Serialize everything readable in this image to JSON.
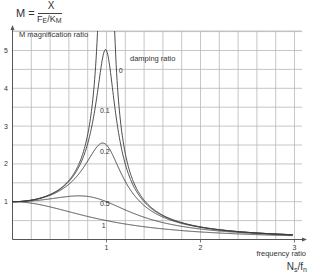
{
  "formula": {
    "lhs": "M =",
    "numerator": "X",
    "denominator_f": "F",
    "denominator_f_sub": "E",
    "denominator_slash": "/",
    "denominator_k": "K",
    "denominator_k_sub": "M"
  },
  "colors": {
    "grid": "#b8b8b8",
    "axis": "#555555",
    "curve": "#3a3a3a",
    "text": "#333333",
    "background": "#ffffff"
  },
  "chart_data": {
    "type": "line",
    "ylabel": "M magnification ratio",
    "xlabel": "frequency ratio",
    "xlabel_symbol": "Ns/fn",
    "legend_title": "damping ratio",
    "xlim": [
      0,
      3.05
    ],
    "ylim": [
      0,
      5.5
    ],
    "x_ticks": [
      1,
      2,
      3
    ],
    "y_ticks": [
      1,
      2,
      3,
      4,
      5
    ],
    "x_grid_step": 0.2,
    "y_grid_step": 0.5,
    "grid": true,
    "formula": "M = 1 / sqrt((1 - r^2)^2 + (2*zeta*r)^2)",
    "series": [
      {
        "name": "0",
        "damping": 0.0,
        "label": "0",
        "label_pos": [
          1.13,
          4.4
        ],
        "x": [
          0,
          0.2,
          0.4,
          0.6,
          0.8,
          0.9,
          1.2,
          1.5,
          2.0,
          2.5,
          3.0
        ],
        "values": [
          1.0,
          1.04,
          1.19,
          1.56,
          2.78,
          5.26,
          2.27,
          0.8,
          0.33,
          0.19,
          0.13
        ]
      },
      {
        "name": "0.1",
        "damping": 0.1,
        "label": "0.1",
        "label_pos": [
          0.93,
          3.35
        ],
        "x": [
          0,
          0.2,
          0.4,
          0.6,
          0.8,
          0.9,
          1.0,
          1.2,
          1.5,
          2.0,
          2.5,
          3.0
        ],
        "values": [
          1.0,
          1.04,
          1.18,
          1.54,
          2.6,
          3.91,
          5.0,
          2.09,
          0.78,
          0.33,
          0.19,
          0.12
        ]
      },
      {
        "name": "0.2",
        "damping": 0.2,
        "label": "0.2",
        "label_pos": [
          0.93,
          2.27
        ],
        "x": [
          0,
          0.2,
          0.4,
          0.6,
          0.8,
          1.0,
          1.2,
          1.5,
          2.0,
          2.5,
          3.0
        ],
        "values": [
          1.0,
          1.04,
          1.17,
          1.47,
          2.13,
          2.5,
          1.7,
          0.73,
          0.32,
          0.18,
          0.12
        ]
      },
      {
        "name": "0.5",
        "damping": 0.5,
        "label": "0.5",
        "label_pos": [
          0.93,
          0.88
        ],
        "x": [
          0,
          0.2,
          0.4,
          0.6,
          0.8,
          1.0,
          1.2,
          1.5,
          2.0,
          2.5,
          3.0
        ],
        "values": [
          1.0,
          1.02,
          1.07,
          1.11,
          1.05,
          1.0,
          0.75,
          0.5,
          0.28,
          0.17,
          0.12
        ]
      },
      {
        "name": "1",
        "damping": 1.0,
        "label": "1",
        "label_pos": [
          0.95,
          0.3
        ],
        "x": [
          0,
          0.2,
          0.4,
          0.6,
          0.8,
          1.0,
          1.2,
          1.5,
          2.0,
          2.5,
          3.0
        ],
        "values": [
          1.0,
          0.96,
          0.86,
          0.74,
          0.61,
          0.5,
          0.41,
          0.31,
          0.2,
          0.14,
          0.1
        ]
      }
    ]
  }
}
